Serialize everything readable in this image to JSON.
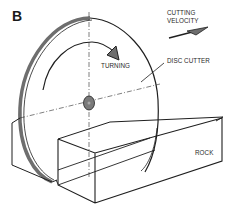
{
  "figure": {
    "panel_label": "B",
    "labels": {
      "cutting_velocity_line1": "CUTTING",
      "cutting_velocity_line2": "VELOCITY",
      "turning": "TURNING",
      "disc_cutter": "DISC CUTTER",
      "rock": "ROCK"
    },
    "colors": {
      "line": "#1f1f1f",
      "disc_edge": "#6e6e6e",
      "hub": "#7a7a7a",
      "text": "#2a2a2a",
      "background": "#ffffff"
    }
  }
}
